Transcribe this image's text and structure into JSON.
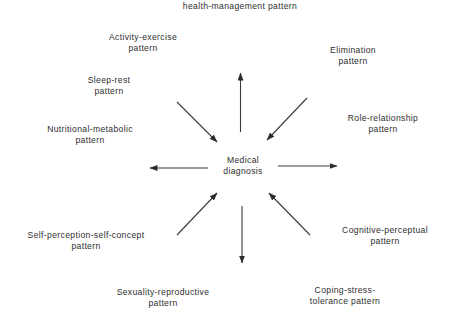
{
  "diagram": {
    "center": {
      "id": "medical-diagnosis",
      "lines": [
        "Medical",
        "diagnosis"
      ],
      "pos": [
        243,
        166
      ]
    },
    "nodes": [
      {
        "id": "health-perception",
        "lines": [
          "health-management pattern"
        ],
        "pos": [
          240,
          6
        ],
        "arrow_direction": "outward"
      },
      {
        "id": "activity-exercise",
        "lines": [
          "Activity-exercise",
          "pattern"
        ],
        "pos": [
          143,
          43
        ],
        "arrow_direction": "none"
      },
      {
        "id": "elimination",
        "lines": [
          "Elimination",
          "pattern"
        ],
        "pos": [
          353,
          56
        ],
        "arrow_direction": "inward"
      },
      {
        "id": "sleep-rest",
        "lines": [
          "Sleep-rest",
          "pattern"
        ],
        "pos": [
          109,
          86
        ],
        "arrow_direction": "inward"
      },
      {
        "id": "role-relationship",
        "lines": [
          "Role-relationship",
          "pattern"
        ],
        "pos": [
          383,
          124
        ],
        "arrow_direction": "outward"
      },
      {
        "id": "nutritional-metabolic",
        "lines": [
          "Nutritional-metabolic",
          "pattern"
        ],
        "pos": [
          90,
          135
        ],
        "arrow_direction": "outward"
      },
      {
        "id": "cognitive-perceptual",
        "lines": [
          "Cognitive-perceptual",
          "pattern"
        ],
        "pos": [
          385,
          236
        ],
        "arrow_direction": "inward"
      },
      {
        "id": "self-perception",
        "lines": [
          "Self-perception-self-concept",
          "pattern"
        ],
        "pos": [
          86,
          241
        ],
        "arrow_direction": "inward"
      },
      {
        "id": "sexuality-reproductive",
        "lines": [
          "Sexuality-reproductive",
          "pattern"
        ],
        "pos": [
          163,
          298
        ],
        "arrow_direction": "outward"
      },
      {
        "id": "coping-stress",
        "lines": [
          "Coping-stress-",
          "tolerance pattern"
        ],
        "pos": [
          345,
          296
        ],
        "arrow_direction": "none"
      }
    ],
    "arrows": [
      {
        "name": "arrow-up-to-health-perception",
        "from": [
          240.5,
          132
        ],
        "to": [
          240.5,
          73
        ]
      },
      {
        "name": "arrow-from-sleep-rest",
        "from": [
          177,
          102
        ],
        "to": [
          217,
          142
        ]
      },
      {
        "name": "arrow-from-elimination",
        "from": [
          307,
          98
        ],
        "to": [
          267,
          140
        ]
      },
      {
        "name": "arrow-left-to-nutritional",
        "from": [
          208,
          168
        ],
        "to": [
          150,
          168
        ]
      },
      {
        "name": "arrow-right-to-role-relationship",
        "from": [
          278,
          166
        ],
        "to": [
          337,
          166
        ]
      },
      {
        "name": "arrow-from-self-perception",
        "from": [
          177,
          235
        ],
        "to": [
          217,
          193
        ]
      },
      {
        "name": "arrow-from-cognitive-perceptual",
        "from": [
          310,
          235
        ],
        "to": [
          269,
          193
        ]
      },
      {
        "name": "arrow-down-to-sexuality",
        "from": [
          242,
          206
        ],
        "to": [
          242,
          263
        ]
      }
    ],
    "colors": {
      "line": "#3a3a3a",
      "text": "#2e2e2e",
      "background": "#ffffff"
    }
  }
}
